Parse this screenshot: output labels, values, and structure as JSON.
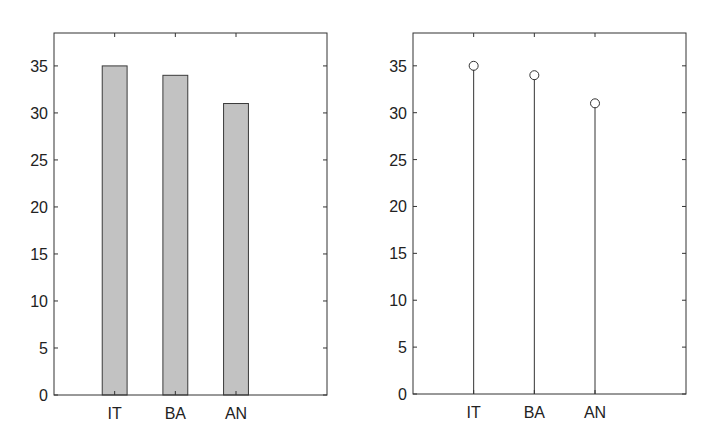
{
  "colors": {
    "bar_fill": "#c2c2c2",
    "bar_edge": "#3a3a3a",
    "axis": "#333333",
    "stem": "#333333",
    "text": "#222222"
  },
  "chart_data": [
    {
      "type": "bar",
      "title": "",
      "xlabel": "",
      "ylabel": "",
      "categories": [
        "IT",
        "BA",
        "AN"
      ],
      "values": [
        35,
        34,
        31
      ],
      "ylim": [
        0,
        38.5
      ],
      "xlim": [
        0,
        4.5
      ],
      "yticks": [
        0,
        5,
        10,
        15,
        20,
        25,
        30,
        35
      ],
      "grid": false,
      "legend": null,
      "box": {
        "left": 54,
        "top": 33,
        "right": 327,
        "bottom": 395
      },
      "bar_width": 0.41
    },
    {
      "type": "stem",
      "title": "",
      "xlabel": "",
      "ylabel": "",
      "categories": [
        "IT",
        "BA",
        "AN"
      ],
      "values": [
        35,
        34,
        31
      ],
      "ylim": [
        0,
        38.5
      ],
      "xlim": [
        0,
        4.5
      ],
      "yticks": [
        0,
        5,
        10,
        15,
        20,
        25,
        30,
        35
      ],
      "grid": false,
      "legend": null,
      "marker": "open-circle",
      "box": {
        "left": 413,
        "top": 33,
        "right": 686,
        "bottom": 394
      }
    }
  ]
}
